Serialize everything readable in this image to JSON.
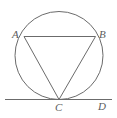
{
  "figure": {
    "kind": "geometry-diagram",
    "background_color": "#ffffff",
    "stroke_color": "#6b6b6b",
    "label_color": "#5c5c5c",
    "stroke_width": 1,
    "circle": {
      "center_x": 59,
      "center_y": 55.5,
      "radius": 44
    },
    "points": {
      "A": {
        "x": 24,
        "y": 36.5,
        "label": "A"
      },
      "B": {
        "x": 95.5,
        "y": 36.5,
        "label": "B"
      },
      "C": {
        "x": 59,
        "y": 99.5,
        "label": "C"
      },
      "D": {
        "x": 100,
        "y": 99.5,
        "label": "D"
      }
    },
    "segments": [
      {
        "name": "chord-AB",
        "from": "A",
        "to": "B"
      },
      {
        "name": "chord-AC",
        "from": "A",
        "to": "C"
      },
      {
        "name": "chord-BC",
        "from": "B",
        "to": "C"
      },
      {
        "name": "tangent-CD",
        "from": "tangent-left",
        "to": "tangent-right"
      }
    ],
    "tangent_line": {
      "x1": 5,
      "y1": 99.5,
      "x2": 112,
      "y2": 99.5
    }
  }
}
